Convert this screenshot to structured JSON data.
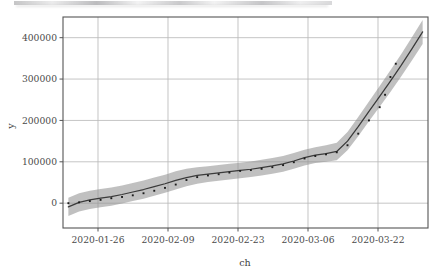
{
  "figure": {
    "background_color": "#ffffff",
    "plot_area": {
      "left": 63,
      "top": 17,
      "right": 428,
      "bottom": 228
    }
  },
  "artifacts": {
    "top_scan_strip_label": "scan-artifact-strip"
  },
  "chart_data": {
    "type": "line",
    "title": "",
    "subtitle": "",
    "xlabel": "ch",
    "ylabel": "y",
    "grid": true,
    "legend": "none",
    "xlim": [
      "2020-01-21",
      "2020-03-29"
    ],
    "ylim": [
      -60000,
      450000
    ],
    "x_tick_labels": [
      "2020-01-26",
      "2020-02-09",
      "2020-02-23",
      "2020-03-06",
      "2020-03-22"
    ],
    "x_tick_positions_px": [
      98,
      168,
      238,
      308,
      378
    ],
    "y_tick_labels": [
      "0",
      "100000",
      "200000",
      "300000",
      "400000"
    ],
    "y_tick_values": [
      0,
      100000,
      200000,
      300000,
      400000
    ],
    "series": [
      {
        "name": "fit",
        "style": "solid-line",
        "color": "#3a3a3a",
        "x": [
          "2020-01-22",
          "2020-01-24",
          "2020-01-26",
          "2020-01-28",
          "2020-01-30",
          "2020-02-01",
          "2020-02-03",
          "2020-02-05",
          "2020-02-07",
          "2020-02-09",
          "2020-02-11",
          "2020-02-13",
          "2020-02-15",
          "2020-02-17",
          "2020-02-19",
          "2020-02-21",
          "2020-02-23",
          "2020-02-25",
          "2020-02-27",
          "2020-02-29",
          "2020-03-02",
          "2020-03-04",
          "2020-03-06",
          "2020-03-08",
          "2020-03-10",
          "2020-03-12",
          "2020-03-14",
          "2020-03-16",
          "2020-03-18",
          "2020-03-20",
          "2020-03-22",
          "2020-03-24",
          "2020-03-26",
          "2020-03-28"
        ],
        "values": [
          -9000,
          2000,
          8000,
          12000,
          16000,
          21000,
          27000,
          33000,
          40000,
          47000,
          55000,
          62000,
          67000,
          70000,
          73000,
          76000,
          79000,
          82000,
          86000,
          90000,
          95000,
          102000,
          110000,
          116000,
          120000,
          125000,
          150000,
          185000,
          222000,
          258000,
          295000,
          333000,
          373000,
          414000
        ]
      },
      {
        "name": "observed",
        "style": "dotted-points",
        "color": "#1c1c1c",
        "x": [
          "2020-01-22",
          "2020-01-24",
          "2020-01-26",
          "2020-01-28",
          "2020-01-30",
          "2020-02-01",
          "2020-02-03",
          "2020-02-05",
          "2020-02-07",
          "2020-02-09",
          "2020-02-11",
          "2020-02-13",
          "2020-02-15",
          "2020-02-17",
          "2020-02-19",
          "2020-02-21",
          "2020-02-23",
          "2020-02-25",
          "2020-02-27",
          "2020-02-29",
          "2020-03-02",
          "2020-03-04",
          "2020-03-06",
          "2020-03-08",
          "2020-03-10",
          "2020-03-12",
          "2020-03-14",
          "2020-03-16",
          "2020-03-18",
          "2020-03-20",
          "2020-03-21",
          "2020-03-22",
          "2020-03-23"
        ],
        "values": [
          0,
          2000,
          5000,
          8000,
          12000,
          15000,
          19000,
          24000,
          30000,
          37000,
          45000,
          56000,
          63000,
          67000,
          70000,
          74000,
          78000,
          80000,
          83000,
          87000,
          92000,
          99000,
          108000,
          114000,
          118000,
          123000,
          140000,
          168000,
          200000,
          232000,
          262000,
          305000,
          337000
        ]
      },
      {
        "name": "confidence-band",
        "style": "shaded-ribbon",
        "color": "#8c8c8c",
        "opacity": 0.55,
        "lower": [
          -31000,
          -20000,
          -14000,
          -10000,
          -6000,
          -1000,
          5000,
          11000,
          18000,
          25000,
          33000,
          41000,
          47000,
          51000,
          54000,
          57000,
          60000,
          63000,
          67000,
          71000,
          76000,
          83000,
          91000,
          97000,
          100000,
          104000,
          128000,
          162000,
          198000,
          233000,
          269000,
          306000,
          345000,
          385000
        ],
        "upper": [
          13000,
          24000,
          30000,
          34000,
          38000,
          43000,
          49000,
          55000,
          62000,
          69000,
          77000,
          83000,
          87000,
          89000,
          92000,
          95000,
          98000,
          101000,
          105000,
          109000,
          114000,
          121000,
          129000,
          135000,
          140000,
          146000,
          172000,
          208000,
          246000,
          283000,
          321000,
          360000,
          401000,
          443000
        ]
      }
    ]
  }
}
